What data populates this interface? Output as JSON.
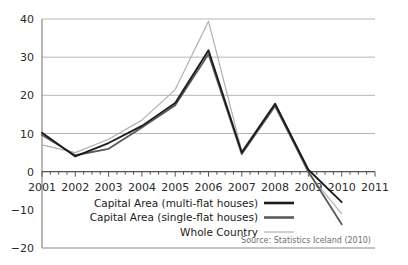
{
  "chart_data": {
    "type": "line",
    "title": "",
    "subtitle": "",
    "xlabel": "",
    "ylabel": "",
    "xlim": [
      2001,
      2011
    ],
    "ylim": [
      -20,
      40
    ],
    "yticks": [
      -20,
      -10,
      0,
      10,
      20,
      30,
      40
    ],
    "ytick_labels": [
      "−20",
      "−10",
      "0",
      "10",
      "20",
      "30",
      "40"
    ],
    "xticks": [
      2001,
      2002,
      2003,
      2004,
      2005,
      2006,
      2007,
      2008,
      2009,
      2010,
      2011
    ],
    "xtick_labels": [
      "2001",
      "2002",
      "2003",
      "2004",
      "2005",
      "2006",
      "2007",
      "2008",
      "2009",
      "2010",
      "2011"
    ],
    "minor_ticks_per_year": 4,
    "grid": "horizontal",
    "legend_position": "inside-bottom-left",
    "x": [
      2001,
      2002,
      2003,
      2004,
      2005,
      2006,
      2007,
      2008,
      2009,
      2010
    ],
    "series": [
      {
        "name": "Capital Area (multi-flat houses)",
        "color": "#1a1a1a",
        "width": 1.8,
        "values": [
          10.2,
          4.0,
          7.5,
          12.0,
          18.0,
          31.8,
          5.0,
          17.8,
          0.5,
          -8.0
        ]
      },
      {
        "name": "Capital Area (single-flat houses)",
        "color": "#5a5a5a",
        "width": 1.8,
        "values": [
          9.6,
          4.3,
          6.0,
          11.6,
          17.4,
          30.8,
          4.6,
          17.2,
          0.0,
          -13.8
        ]
      },
      {
        "name": "Whole Country",
        "color": "#b0b0b0",
        "width": 1.2,
        "values": [
          7.0,
          5.0,
          8.5,
          13.5,
          21.5,
          39.4,
          5.4,
          18.0,
          -0.5,
          -11.0
        ]
      }
    ],
    "annotations": [
      {
        "name": "source-note",
        "text": "Source: Statistics Iceland (2010)"
      }
    ]
  },
  "legend": {
    "items": [
      {
        "label": "Capital Area (multi-flat houses)",
        "color": "#1a1a1a",
        "width": 2.6
      },
      {
        "label": "Capital Area (single-flat houses)",
        "color": "#5a5a5a",
        "width": 2.6
      },
      {
        "label": "Whole Country",
        "color": "#b0b0b0",
        "width": 1.2
      }
    ]
  },
  "colors": {
    "axis": "#555555",
    "grid": "#b6b6b6",
    "frame": "#888888",
    "background": "#ffffff",
    "text": "#1a1a1a",
    "source_text": "#6e6e6e"
  },
  "source": {
    "text": "Source: Statistics Iceland (2010)"
  }
}
